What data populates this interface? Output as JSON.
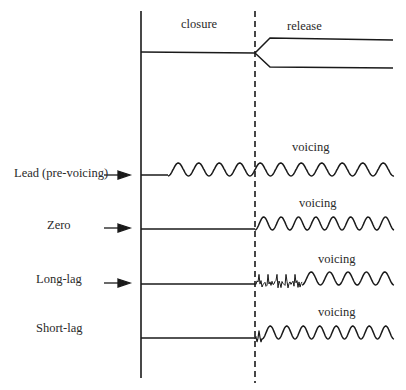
{
  "diagram": {
    "top_labels": {
      "closure": "closure",
      "release": "release"
    },
    "rows": [
      {
        "label": "Lead (pre-voicing)",
        "voicing_label": "voicing",
        "has_arrow": true
      },
      {
        "label": "Zero",
        "voicing_label": "voicing",
        "has_arrow": true
      },
      {
        "label": "Long-lag",
        "voicing_label": "voicing",
        "has_arrow": true
      },
      {
        "label": "Short-lag",
        "voicing_label": "voicing",
        "has_arrow": false
      }
    ],
    "colors": {
      "line": "#1a1a1a",
      "text": "#2a2a2a",
      "background": "#ffffff"
    }
  }
}
